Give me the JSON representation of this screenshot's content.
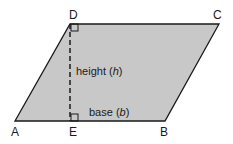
{
  "diagram": {
    "type": "parallelogram",
    "fill_color": "#c8c8c8",
    "stroke_color": "#1a1a1a",
    "vertices": {
      "A": {
        "label": "A"
      },
      "B": {
        "label": "B"
      },
      "C": {
        "label": "C"
      },
      "D": {
        "label": "D"
      },
      "E": {
        "label": "E"
      }
    },
    "height_label": "height (",
    "height_var": "h",
    "height_close": ")",
    "base_label": "base (",
    "base_var": "b",
    "base_close": ")"
  }
}
